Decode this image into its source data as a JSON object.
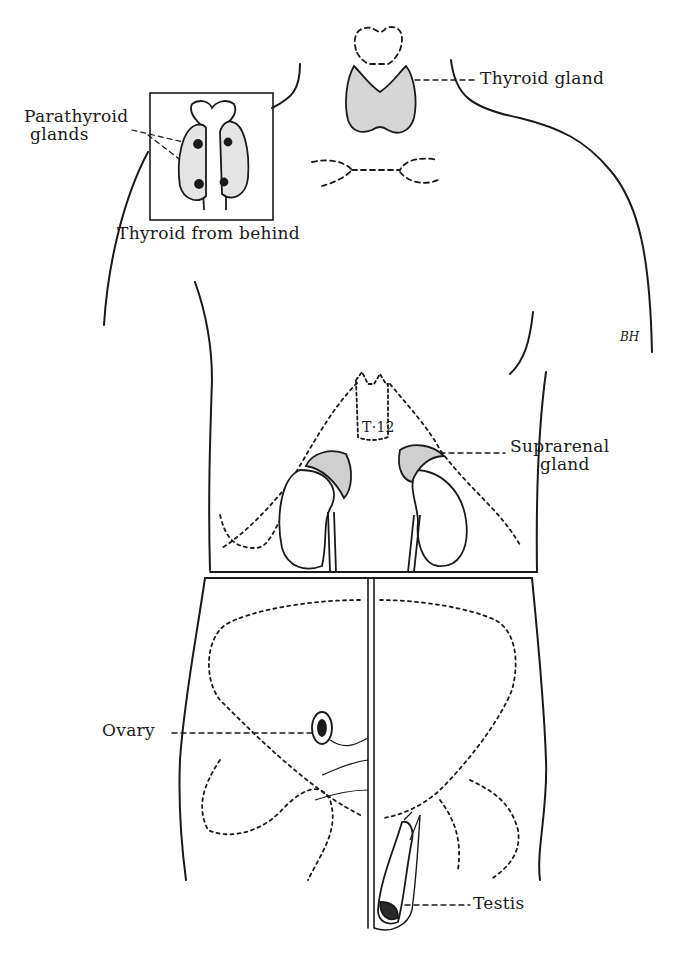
{
  "figure": {
    "labels": {
      "parathyroid": "Parathyroid glands",
      "parathyroid_line1": "Parathyroid",
      "parathyroid_line2": "glands",
      "thyroid_from_behind": "Thyroid from behind",
      "thyroid_gland": "Thyroid gland",
      "vertebra": "T·12",
      "suprarenal_line1": "Suprarenal",
      "suprarenal_line2": "gland",
      "ovary": "Ovary",
      "testis": "Testis"
    },
    "signature": "BH",
    "colors": {
      "ink": "#1a1a1a",
      "background": "#ffffff"
    }
  }
}
